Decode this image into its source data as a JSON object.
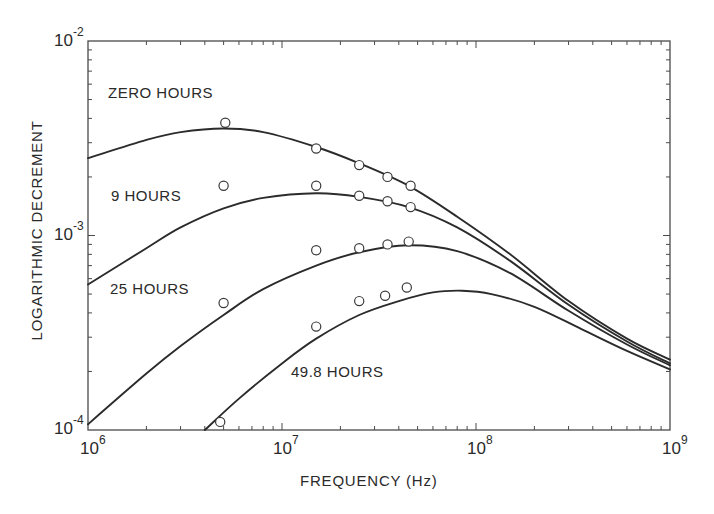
{
  "chart_data": {
    "type": "line",
    "title": "",
    "xlabel": "FREQUENCY (Hz)",
    "ylabel": "LOGARITHMIC DECREMENT",
    "xscale": "log",
    "yscale": "log",
    "xlim": [
      1000000.0,
      1000000000.0
    ],
    "ylim": [
      0.0001,
      0.01
    ],
    "grid": false,
    "legend": "inline labels",
    "x_tick_labels": [
      {
        "base": "10",
        "exp": "6",
        "value": 1000000.0
      },
      {
        "base": "10",
        "exp": "7",
        "value": 10000000.0
      },
      {
        "base": "10",
        "exp": "8",
        "value": 100000000.0
      },
      {
        "base": "10",
        "exp": "9",
        "value": 1000000000.0
      }
    ],
    "y_tick_labels": [
      {
        "base": "10",
        "exp": "-2",
        "value": 0.01
      },
      {
        "base": "10",
        "exp": "-3",
        "value": 0.001
      },
      {
        "base": "10",
        "exp": "-4",
        "value": 0.0001
      }
    ],
    "series": [
      {
        "name": "ZERO HOURS",
        "points": [
          [
            5100000.0,
            0.0038
          ],
          [
            15000000.0,
            0.0028
          ],
          [
            25000000.0,
            0.0023
          ],
          [
            35000000.0,
            0.002
          ],
          [
            46000000.0,
            0.0018
          ]
        ],
        "curve": [
          [
            1000000.0,
            0.0025
          ],
          [
            2000000.0,
            0.0031
          ],
          [
            3000000.0,
            0.0034
          ],
          [
            5000000.0,
            0.00355
          ],
          [
            8000000.0,
            0.0034
          ],
          [
            15000000.0,
            0.00285
          ],
          [
            25000000.0,
            0.00235
          ],
          [
            45000000.0,
            0.0018
          ],
          [
            80000000.0,
            0.00125
          ],
          [
            150000000.0,
            0.0008
          ],
          [
            300000000.0,
            0.00046
          ],
          [
            600000000.0,
            0.000295
          ],
          [
            1000000000.0,
            0.00023
          ]
        ]
      },
      {
        "name": "9 HOURS",
        "points": [
          [
            5000000.0,
            0.0018
          ],
          [
            15000000.0,
            0.0018
          ],
          [
            25000000.0,
            0.0016
          ],
          [
            35000000.0,
            0.0015
          ],
          [
            46000000.0,
            0.0014
          ]
        ],
        "curve": [
          [
            1000000.0,
            0.00056
          ],
          [
            2000000.0,
            0.00086
          ],
          [
            3000000.0,
            0.0011
          ],
          [
            5000000.0,
            0.00138
          ],
          [
            8000000.0,
            0.00156
          ],
          [
            15000000.0,
            0.00165
          ],
          [
            25000000.0,
            0.00158
          ],
          [
            45000000.0,
            0.0014
          ],
          [
            80000000.0,
            0.0011
          ],
          [
            150000000.0,
            0.00074
          ],
          [
            300000000.0,
            0.00044
          ],
          [
            600000000.0,
            0.000285
          ],
          [
            1000000000.0,
            0.00022
          ]
        ]
      },
      {
        "name": "25 HOURS",
        "points": [
          [
            5000000.0,
            0.00045
          ],
          [
            15000000.0,
            0.00084
          ],
          [
            25000000.0,
            0.00086
          ],
          [
            35000000.0,
            0.0009
          ],
          [
            45000000.0,
            0.00093
          ]
        ],
        "curve": [
          [
            1000000.0,
            0.000107
          ],
          [
            2000000.0,
            0.000195
          ],
          [
            3000000.0,
            0.00027
          ],
          [
            5000000.0,
            0.00039
          ],
          [
            8000000.0,
            0.00053
          ],
          [
            15000000.0,
            0.0007
          ],
          [
            25000000.0,
            0.00082
          ],
          [
            45000000.0,
            0.00089
          ],
          [
            80000000.0,
            0.00083
          ],
          [
            150000000.0,
            0.00064
          ],
          [
            300000000.0,
            0.00041
          ],
          [
            600000000.0,
            0.000275
          ],
          [
            1000000000.0,
            0.000215
          ]
        ]
      },
      {
        "name": "49.8 HOURS",
        "points": [
          [
            4800000.0,
            0.00011
          ],
          [
            15000000.0,
            0.00034
          ],
          [
            25000000.0,
            0.00046
          ],
          [
            34000000.0,
            0.00049
          ],
          [
            44000000.0,
            0.00054
          ]
        ],
        "curve": [
          [
            4000000.0,
            0.0001
          ],
          [
            6000000.0,
            0.000145
          ],
          [
            10000000.0,
            0.00022
          ],
          [
            15000000.0,
            0.000295
          ],
          [
            25000000.0,
            0.00039
          ],
          [
            40000000.0,
            0.00046
          ],
          [
            60000000.0,
            0.00051
          ],
          [
            85000000.0,
            0.00052
          ],
          [
            120000000.0,
            0.0005
          ],
          [
            200000000.0,
            0.00043
          ],
          [
            350000000.0,
            0.00033
          ],
          [
            600000000.0,
            0.000255
          ],
          [
            1000000000.0,
            0.000205
          ]
        ]
      }
    ],
    "annotations": [
      {
        "text": "ZERO HOURS",
        "x_px": 108,
        "y_px": 92
      },
      {
        "text": "9 HOURS",
        "x_px": 111,
        "y_px": 195
      },
      {
        "text": "25 HOURS",
        "x_px": 110,
        "y_px": 288
      },
      {
        "text": "49.8 HOURS",
        "x_px": 291,
        "y_px": 371
      }
    ]
  },
  "colors": {
    "line": "#2b2b2b",
    "axis": "#4a4a4a",
    "background": "#ffffff"
  }
}
